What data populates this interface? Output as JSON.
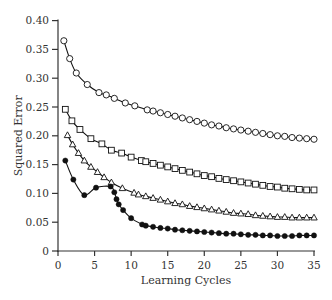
{
  "chart_data": {
    "type": "line",
    "title": "",
    "xlabel": "Learning Cycles",
    "ylabel": "Squared Error",
    "xlim": [
      0,
      35
    ],
    "ylim": [
      0,
      0.4
    ],
    "xticks": [
      0,
      5,
      10,
      15,
      20,
      25,
      30,
      35
    ],
    "xtick_labels": [
      "0",
      "5",
      "10",
      "15",
      "20",
      "25",
      "30",
      "35"
    ],
    "yticks": [
      0,
      0.05,
      0.1,
      0.15,
      0.2,
      0.25,
      0.3,
      0.35,
      0.4
    ],
    "ytick_labels": [
      "0",
      "0.05",
      "0.10",
      "0.15",
      "0.20",
      "0.25",
      "0.30",
      "0.35",
      "0.40"
    ],
    "grid": false,
    "legend": "none",
    "series": [
      {
        "name": "open-circles",
        "marker": "circle-open",
        "points": [
          [
            0.8,
            0.365
          ],
          [
            1.6,
            0.334
          ],
          [
            2.5,
            0.309
          ],
          [
            4.0,
            0.289
          ],
          [
            5.6,
            0.275
          ],
          [
            6.6,
            0.271
          ],
          [
            7.7,
            0.265
          ],
          [
            9.2,
            0.257
          ],
          [
            10.5,
            0.252
          ],
          [
            12.2,
            0.245
          ],
          [
            13,
            0.243
          ],
          [
            14,
            0.24
          ],
          [
            15,
            0.237
          ],
          [
            16,
            0.234
          ],
          [
            17,
            0.231
          ],
          [
            18,
            0.228
          ],
          [
            19,
            0.225
          ],
          [
            20,
            0.222
          ],
          [
            21,
            0.219
          ],
          [
            22,
            0.217
          ],
          [
            23,
            0.214
          ],
          [
            24,
            0.212
          ],
          [
            25,
            0.21
          ],
          [
            26,
            0.208
          ],
          [
            27,
            0.206
          ],
          [
            28,
            0.204
          ],
          [
            29,
            0.202
          ],
          [
            30,
            0.2
          ],
          [
            31,
            0.199
          ],
          [
            32,
            0.197
          ],
          [
            33,
            0.196
          ],
          [
            34,
            0.195
          ],
          [
            35,
            0.194
          ]
        ]
      },
      {
        "name": "open-squares",
        "marker": "square-open",
        "points": [
          [
            1.0,
            0.246
          ],
          [
            1.9,
            0.226
          ],
          [
            3.0,
            0.211
          ],
          [
            4.5,
            0.195
          ],
          [
            6.0,
            0.186
          ],
          [
            7.3,
            0.175
          ],
          [
            8.7,
            0.17
          ],
          [
            10.0,
            0.163
          ],
          [
            11.4,
            0.157
          ],
          [
            12,
            0.155
          ],
          [
            13,
            0.152
          ],
          [
            14,
            0.149
          ],
          [
            15,
            0.146
          ],
          [
            16,
            0.143
          ],
          [
            17,
            0.14
          ],
          [
            18,
            0.137
          ],
          [
            19,
            0.134
          ],
          [
            20,
            0.131
          ],
          [
            21,
            0.129
          ],
          [
            22,
            0.126
          ],
          [
            23,
            0.124
          ],
          [
            24,
            0.122
          ],
          [
            25,
            0.12
          ],
          [
            26,
            0.118
          ],
          [
            27,
            0.116
          ],
          [
            28,
            0.114
          ],
          [
            29,
            0.112
          ],
          [
            30,
            0.111
          ],
          [
            31,
            0.109
          ],
          [
            32,
            0.108
          ],
          [
            33,
            0.107
          ],
          [
            34,
            0.106
          ],
          [
            35,
            0.106
          ]
        ]
      },
      {
        "name": "open-triangles",
        "marker": "triangle-open",
        "points": [
          [
            1.3,
            0.201
          ],
          [
            2.0,
            0.185
          ],
          [
            2.8,
            0.17
          ],
          [
            3.6,
            0.157
          ],
          [
            4.5,
            0.146
          ],
          [
            5.4,
            0.137
          ],
          [
            6.3,
            0.128
          ],
          [
            7.3,
            0.119
          ],
          [
            8.8,
            0.109
          ],
          [
            10.4,
            0.101
          ],
          [
            11,
            0.098
          ],
          [
            12,
            0.095
          ],
          [
            13,
            0.092
          ],
          [
            14,
            0.089
          ],
          [
            15,
            0.086
          ],
          [
            16,
            0.083
          ],
          [
            17,
            0.081
          ],
          [
            18,
            0.078
          ],
          [
            19,
            0.076
          ],
          [
            20,
            0.074
          ],
          [
            21,
            0.072
          ],
          [
            22,
            0.07
          ],
          [
            23,
            0.068
          ],
          [
            24,
            0.066
          ],
          [
            25,
            0.065
          ],
          [
            26,
            0.064
          ],
          [
            27,
            0.062
          ],
          [
            28,
            0.061
          ],
          [
            29,
            0.06
          ],
          [
            30,
            0.059
          ],
          [
            31,
            0.059
          ],
          [
            32,
            0.058
          ],
          [
            33,
            0.058
          ],
          [
            34,
            0.058
          ],
          [
            35,
            0.058
          ]
        ]
      },
      {
        "name": "filled-circles",
        "marker": "circle-filled",
        "points": [
          [
            1.0,
            0.157
          ],
          [
            2.1,
            0.124
          ],
          [
            3.6,
            0.097
          ],
          [
            5.2,
            0.11
          ],
          [
            7.2,
            0.112
          ],
          [
            7.7,
            0.102
          ],
          [
            8.0,
            0.09
          ],
          [
            8.3,
            0.081
          ],
          [
            8.9,
            0.071
          ],
          [
            10.0,
            0.057
          ],
          [
            11.5,
            0.046
          ],
          [
            12,
            0.044
          ],
          [
            13,
            0.042
          ],
          [
            14,
            0.04
          ],
          [
            15,
            0.039
          ],
          [
            16,
            0.037
          ],
          [
            17,
            0.036
          ],
          [
            18,
            0.035
          ],
          [
            19,
            0.034
          ],
          [
            20,
            0.033
          ],
          [
            21,
            0.032
          ],
          [
            22,
            0.031
          ],
          [
            23,
            0.03
          ],
          [
            24,
            0.03
          ],
          [
            25,
            0.029
          ],
          [
            26,
            0.028
          ],
          [
            27,
            0.028
          ],
          [
            28,
            0.027
          ],
          [
            29,
            0.027
          ],
          [
            30,
            0.026
          ],
          [
            31,
            0.026
          ],
          [
            32,
            0.026
          ],
          [
            33,
            0.027
          ],
          [
            34,
            0.027
          ],
          [
            35,
            0.027
          ]
        ]
      }
    ]
  }
}
